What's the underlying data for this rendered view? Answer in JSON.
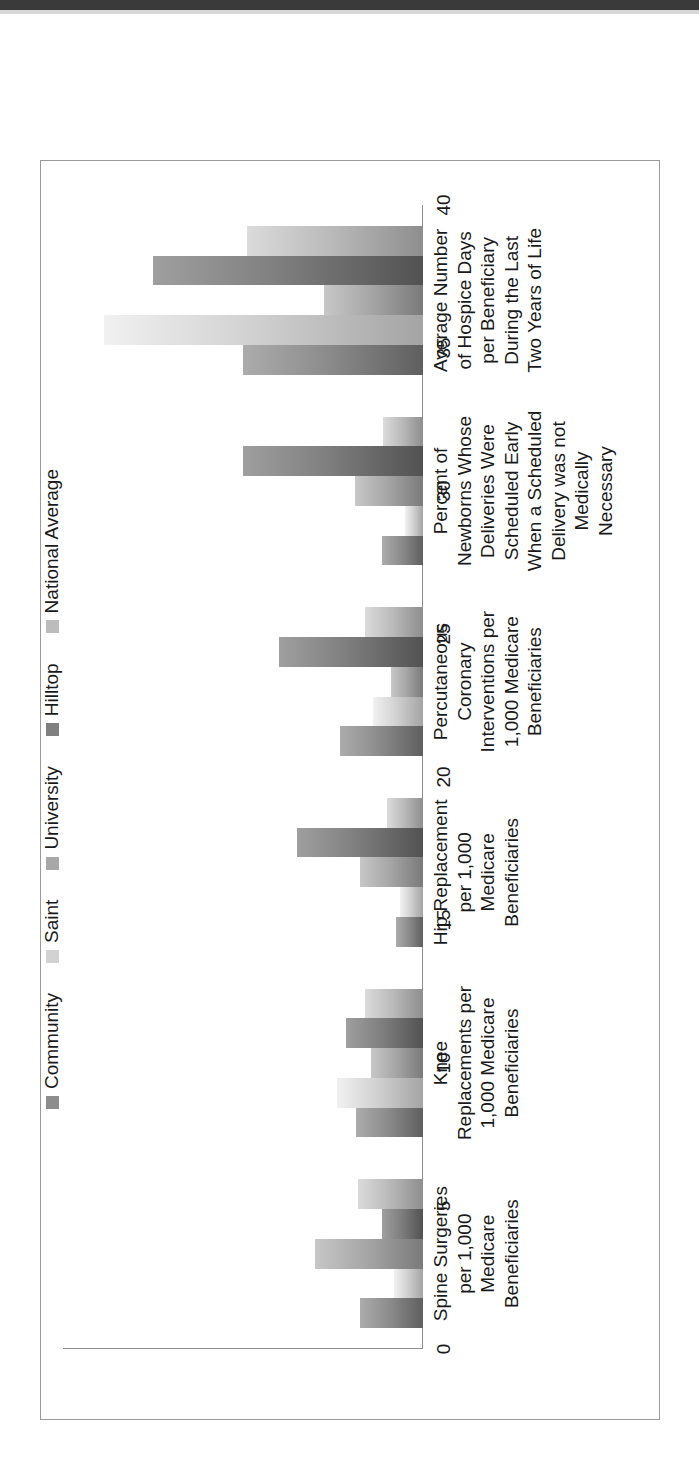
{
  "chart_data": {
    "type": "bar",
    "orientation": "vertical-rendered-rotated",
    "title": "",
    "xlabel": "",
    "ylabel": "",
    "ylim": [
      0,
      40
    ],
    "yticks": [
      "0",
      "5",
      "10",
      "15",
      "20",
      "25",
      "30",
      "35",
      "40"
    ],
    "grid": false,
    "legend_position": "top",
    "categories": [
      "Spine Surgeries per 1,000 Medicare Beneficiaries",
      "Knee Replacements per 1,000 Medicare Beneficiaries",
      "Hip Replacement per 1,000 Medicare Beneficiaries",
      "Percutaneous Coronary Interventions per 1,000 Medicare Beneficiaries",
      "Percent of Newborns Whose Deliveries Were Scheduled Early When a Scheduled Delivery was not Medically Necessary",
      "Average Number of Hospice Days per Beneficiary During the Last Two Years of Life"
    ],
    "category_lines": [
      [
        "Spine Surgeries",
        "per 1,000",
        "Medicare",
        "Beneficiaries"
      ],
      [
        "Knee",
        "Replacements per",
        "1,000 Medicare",
        "Beneficiaries"
      ],
      [
        "Hip Replacement",
        "per 1,000",
        "Medicare",
        "Beneficiaries"
      ],
      [
        "Percutaneous",
        "Coronary",
        "Interventions per",
        "1,000 Medicare",
        "Beneficiaries"
      ],
      [
        "Percent of",
        "Newborns Whose",
        "Deliveries Were",
        "Scheduled Early",
        "When a Scheduled",
        "Delivery was not",
        "Medically",
        "Necessary"
      ],
      [
        "Average Number",
        "of Hospice Days",
        "per Beneficiary",
        "During the Last",
        "Two Years of Life"
      ]
    ],
    "series": [
      {
        "name": "Community",
        "color": "#8d8d8d",
        "values": [
          7.0,
          7.4,
          3.0,
          9.2,
          4.6,
          20.0
        ]
      },
      {
        "name": "Saint",
        "color": "#d2d2d2",
        "values": [
          3.2,
          9.6,
          2.6,
          5.6,
          2.0,
          35.5
        ]
      },
      {
        "name": "University",
        "color": "#a8a8a8",
        "values": [
          12.0,
          5.8,
          7.0,
          3.6,
          7.6,
          11.0
        ]
      },
      {
        "name": "Hilltop",
        "color": "#808080",
        "values": [
          4.6,
          8.6,
          14.0,
          16.0,
          20.0,
          30.0
        ]
      },
      {
        "name": "National Average",
        "color": "#bcbcbc",
        "values": [
          7.2,
          6.4,
          4.0,
          6.4,
          4.4,
          19.6
        ]
      }
    ]
  },
  "legend": {
    "items": [
      {
        "label": "Community"
      },
      {
        "label": "Saint"
      },
      {
        "label": "University"
      },
      {
        "label": "Hilltop"
      },
      {
        "label": "National Average"
      }
    ]
  }
}
